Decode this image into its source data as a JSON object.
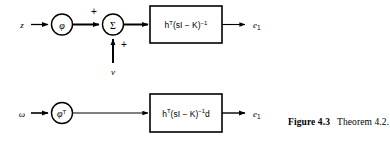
{
  "figure": {
    "caption_label": "Figure 4.3",
    "caption_text": "Theorem 4.2.",
    "ink_color": "#000000",
    "background_color": "#ffffff"
  },
  "diagram_top": {
    "input_label": "z",
    "gain_node_label": "φ",
    "sum_node_label": "Σ",
    "sum_sign_top": "+",
    "sum_sign_bottom": "+",
    "disturbance_label": "v",
    "transfer_block": {
      "base": "h",
      "sup1": "T",
      "body": "(sI − K)",
      "sup2": "−1",
      "tail": ""
    },
    "output_label": "e",
    "output_sub": "1"
  },
  "diagram_bottom": {
    "input_label": "ω",
    "gain_node_base": "φ",
    "gain_node_sup": "T",
    "transfer_block": {
      "base": "h",
      "sup1": "T",
      "body": "(sI − K)",
      "sup2": "−1",
      "tail": "d"
    },
    "output_label": "e",
    "output_sub": "1"
  }
}
